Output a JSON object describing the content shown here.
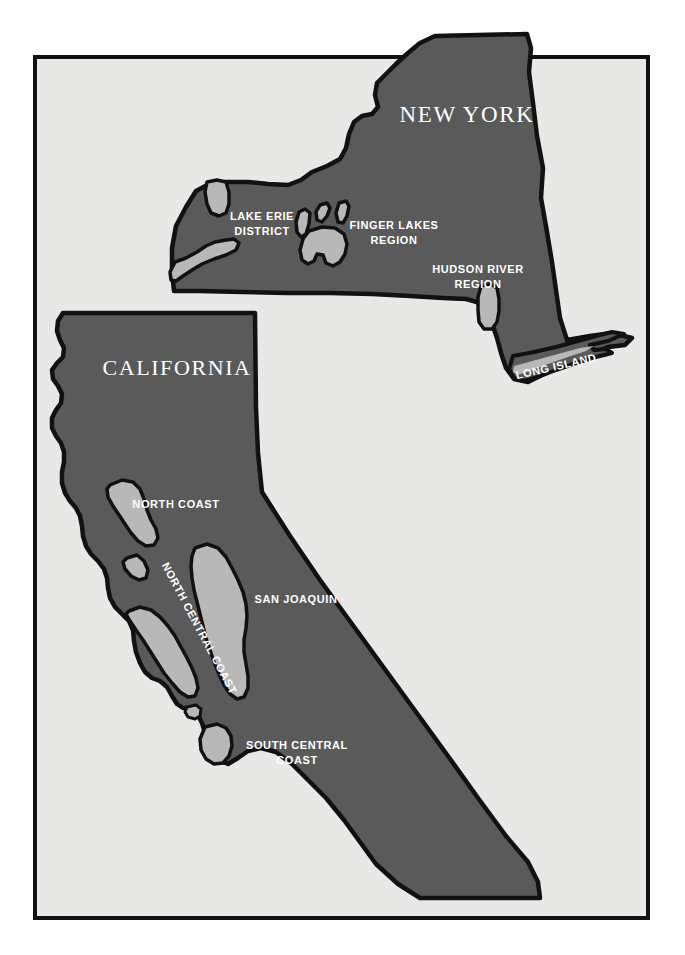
{
  "map": {
    "kind": "wine-region-map",
    "background_color": "#ffffff",
    "frame": {
      "name": "map-frame",
      "fill": "#e8e8e6",
      "stroke": "#111111",
      "x": 35,
      "y": 57,
      "width": 613,
      "height": 861,
      "stroke_width": 4
    },
    "colors": {
      "land_fill": "#5a5a5a",
      "region_fill": "#b8b8b8",
      "outline": "#111111",
      "label_text": "#ffffff",
      "paper": "#e8e8e6"
    },
    "states": [
      {
        "id": "new-york",
        "title": "NEW YORK",
        "title_x": 467,
        "title_y": 122,
        "title_size": 23,
        "regions": [
          {
            "id": "lake-erie-district",
            "label": "LAKE ERIE\nDISTRICT",
            "lines": [
              "LAKE ERIE",
              "DISTRICT"
            ],
            "x": 262,
            "y": 220,
            "size": 11
          },
          {
            "id": "finger-lakes-region",
            "label": "FINGER LAKES\nREGION",
            "lines": [
              "FINGER LAKES",
              "REGION"
            ],
            "x": 394,
            "y": 229,
            "size": 11
          },
          {
            "id": "hudson-river-region",
            "label": "HUDSON RIVER\nREGION",
            "lines": [
              "HUDSON RIVER",
              "REGION"
            ],
            "x": 478,
            "y": 273,
            "size": 11
          },
          {
            "id": "long-island",
            "label": "LONG ISLAND",
            "lines": [
              "LONG ISLAND"
            ],
            "x": 557,
            "y": 370,
            "size": 11,
            "rotation": -13
          }
        ]
      },
      {
        "id": "california",
        "title": "CALIFORNIA",
        "title_x": 177,
        "title_y": 375,
        "title_size": 22,
        "regions": [
          {
            "id": "north-coast",
            "label": "NORTH COAST",
            "lines": [
              "NORTH COAST"
            ],
            "x": 176,
            "y": 508,
            "size": 11
          },
          {
            "id": "north-central-coast",
            "label": "NORTH CENTRAL COAST",
            "lines": [
              "NORTH CENTRAL COAST"
            ],
            "x": 196,
            "y": 630,
            "size": 11,
            "rotation": 62
          },
          {
            "id": "san-joaquin",
            "label": "SAN JOAQUIN",
            "lines": [
              "SAN JOAQUIN"
            ],
            "x": 296,
            "y": 603,
            "size": 11
          },
          {
            "id": "south-central-coast",
            "label": "SOUTH CENTRAL\nCOAST",
            "lines": [
              "SOUTH CENTRAL",
              "COAST"
            ],
            "x": 297,
            "y": 749,
            "size": 11
          }
        ]
      }
    ],
    "shapes": {
      "new_york_outline": "M 435 36 L 527 34 L 531 48 L 529 72 L 533 103 L 537 136 L 543 168 L 541 198 L 547 232 L 552 262 L 556 290 L 560 318 L 567 340 L 590 336 L 612 333 L 632 338 L 625 345 L 608 347 L 596 352 L 588 358 L 572 362 L 555 368 L 540 376 L 528 382 L 514 379 L 506 368 L 501 353 L 497 338 L 492 323 L 484 310 L 477 302 L 466 299 L 443 298 L 410 296 L 372 294 L 330 293 L 286 293 L 243 292 L 199 291 L 174 291 L 172 272 L 172 248 L 176 226 L 186 207 L 196 191 L 209 184 L 225 182 L 248 182 L 268 184 L 288 185 L 301 180 L 312 172 L 327 166 L 340 159 L 346 148 L 349 134 L 354 122 L 362 116 L 372 114 L 378 107 L 375 95 L 377 83 L 385 75 L 396 64 L 408 53 L 420 43 Z",
      "new_york_erie_lake": "M 175 262 L 186 258 L 197 252 L 206 246 L 215 242 L 226 240 L 234 239 L 239 243 L 236 250 L 226 255 L 214 259 L 202 264 L 192 270 L 183 276 L 176 281 L 171 280 L 170 272 Z",
      "new_york_erie_top": "M 207 182 L 217 180 L 226 182 L 229 192 L 229 204 L 226 213 L 219 216 L 211 213 L 207 204 L 205 192 Z",
      "new_york_finger_a": "M 299 212 L 305 209 L 310 213 L 309 224 L 306 234 L 301 237 L 297 232 L 296 222 Z",
      "new_york_finger_b": "M 320 205 L 327 203 L 330 208 L 327 216 L 322 222 L 317 220 L 316 212 Z",
      "new_york_finger_c": "M 339 203 L 346 201 L 349 206 L 347 216 L 343 223 L 338 222 L 336 213 Z",
      "new_york_finger_blob": "M 309 231 L 322 227 L 335 228 L 344 234 L 347 244 L 345 254 L 340 262 L 333 266 L 326 263 L 323 255 L 317 254 L 314 261 L 308 264 L 302 260 L 300 250 L 303 239 Z",
      "new_york_hudson": "M 481 286 L 491 284 L 497 288 L 499 299 L 499 311 L 497 322 L 492 329 L 484 329 L 479 322 L 478 310 L 478 297 Z",
      "new_york_long_island_land": "M 513 356 L 534 352 L 556 347 L 578 341 L 596 336 L 612 332 L 624 334 L 608 341 L 590 345 L 594 350 L 606 349 L 612 353 L 596 357 L 576 363 L 556 370 L 538 377 L 524 381 L 514 378 L 509 369 Z",
      "new_york_long_island_region": "M 514 366 L 536 360 L 558 354 L 580 348 L 594 346 L 586 351 L 568 357 L 548 364 L 530 371 L 518 375 L 513 372 Z",
      "california_outline": "M 63 313 L 255 313 L 256 408 L 258 453 L 262 492 L 290 536 L 320 580 L 352 624 L 384 668 L 416 712 L 448 756 L 478 798 L 506 836 L 528 862 L 538 882 L 540 898 L 460 898 L 420 898 L 398 884 L 376 864 L 360 842 L 344 820 L 326 798 L 308 780 L 292 764 L 276 752 L 261 748 L 248 751 L 238 758 L 228 764 L 218 760 L 210 749 L 206 736 L 202 723 L 197 713 L 190 708 L 183 708 L 177 704 L 172 696 L 167 687 L 160 681 L 152 678 L 145 672 L 140 663 L 136 652 L 134 641 L 133 630 L 129 621 L 122 614 L 115 607 L 110 598 L 108 588 L 107 578 L 104 569 L 98 561 L 91 554 L 86 546 L 83 536 L 82 526 L 80 516 L 76 508 L 70 501 L 65 493 L 62 483 L 62 472 L 64 462 L 64 452 L 61 443 L 56 436 L 52 428 L 52 418 L 56 410 L 61 403 L 62 394 L 58 386 L 53 379 L 52 370 L 57 363 L 63 357 L 64 348 L 60 340 L 57 331 L 58 321 Z",
      "california_north_coast": "M 110 485 L 122 480 L 133 482 L 140 489 L 144 499 L 147 510 L 151 520 L 156 529 L 158 538 L 154 545 L 146 546 L 138 541 L 131 533 L 125 524 L 119 515 L 113 506 L 108 497 L 107 489 Z",
      "california_nc_coast_a": "M 127 558 L 137 555 L 144 561 L 148 570 L 146 578 L 139 580 L 131 576 L 125 569 L 123 562 Z",
      "california_nc_coast_b": "M 129 611 L 140 607 L 151 610 L 160 617 L 168 626 L 175 636 L 181 647 L 187 658 L 192 668 L 196 678 L 198 688 L 195 696 L 188 697 L 180 692 L 172 683 L 164 673 L 157 662 L 150 651 L 143 640 L 136 630 L 130 621 L 126 614 Z",
      "california_inner_valley_a": "M 195 548 L 207 544 L 218 548 L 226 557 L 232 568 L 238 580 L 243 592 L 246 604 L 247 616 L 246 628 L 244 640 L 244 652 L 246 664 L 248 676 L 248 688 L 244 697 L 237 699 L 230 694 L 224 685 L 219 674 L 214 662 L 210 650 L 206 638 L 203 626 L 200 614 L 197 602 L 194 590 L 192 578 L 191 566 L 192 556 Z",
      "california_south_central_dot": "M 187 707 L 196 705 L 201 709 L 200 716 L 195 719 L 188 717 L 185 712 Z",
      "california_south_central_blob": "M 205 727 L 217 724 L 226 728 L 231 736 L 232 746 L 229 756 L 223 763 L 214 764 L 206 759 L 201 750 L 200 739 Z"
    }
  }
}
